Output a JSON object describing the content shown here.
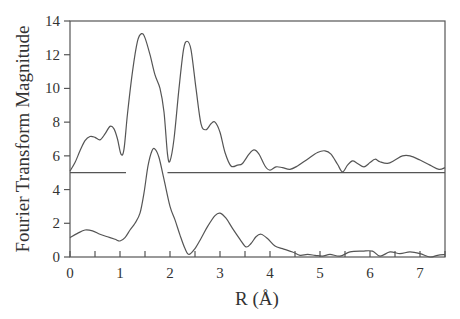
{
  "chart_data": {
    "type": "line",
    "title": "",
    "xlabel": "R (Å)",
    "ylabel": "Fourier Transform Magnitude",
    "xlim": [
      0,
      7.5
    ],
    "ylim": [
      0,
      14
    ],
    "xticks": [
      0,
      1,
      2,
      3,
      4,
      5,
      6,
      7
    ],
    "xtick_labels": [
      "0",
      "1",
      "2",
      "3",
      "4",
      "5",
      "6",
      "7"
    ],
    "yticks": [
      0,
      2,
      4,
      6,
      8,
      10,
      12,
      14
    ],
    "ytick_labels": [
      "0",
      "2",
      "4",
      "6",
      "8",
      "10",
      "12",
      "14"
    ],
    "grid": false,
    "legend": null,
    "series": [
      {
        "name": "upper spectrum (offset +5)",
        "offset": 5,
        "baseline_segments": [
          [
            0,
            1.12
          ],
          [
            1.95,
            7.5
          ]
        ],
        "points": [
          [
            0.0,
            5.1
          ],
          [
            0.1,
            5.6
          ],
          [
            0.2,
            6.3
          ],
          [
            0.3,
            6.9
          ],
          [
            0.4,
            7.15
          ],
          [
            0.5,
            7.1
          ],
          [
            0.6,
            6.95
          ],
          [
            0.7,
            7.3
          ],
          [
            0.8,
            7.75
          ],
          [
            0.88,
            7.6
          ],
          [
            0.95,
            7.0
          ],
          [
            1.02,
            6.1
          ],
          [
            1.08,
            6.4
          ],
          [
            1.15,
            8.5
          ],
          [
            1.25,
            11.0
          ],
          [
            1.35,
            12.8
          ],
          [
            1.43,
            13.25
          ],
          [
            1.5,
            13.0
          ],
          [
            1.6,
            12.0
          ],
          [
            1.7,
            10.8
          ],
          [
            1.8,
            10.0
          ],
          [
            1.88,
            8.6
          ],
          [
            1.95,
            6.1
          ],
          [
            2.0,
            5.7
          ],
          [
            2.08,
            7.0
          ],
          [
            2.18,
            10.0
          ],
          [
            2.27,
            12.3
          ],
          [
            2.34,
            12.8
          ],
          [
            2.42,
            12.3
          ],
          [
            2.52,
            10.0
          ],
          [
            2.62,
            7.9
          ],
          [
            2.72,
            7.55
          ],
          [
            2.82,
            7.9
          ],
          [
            2.9,
            8.0
          ],
          [
            3.0,
            7.4
          ],
          [
            3.1,
            6.2
          ],
          [
            3.22,
            5.4
          ],
          [
            3.35,
            5.45
          ],
          [
            3.45,
            5.55
          ],
          [
            3.58,
            6.1
          ],
          [
            3.68,
            6.35
          ],
          [
            3.78,
            6.1
          ],
          [
            3.9,
            5.4
          ],
          [
            4.0,
            5.15
          ],
          [
            4.12,
            5.35
          ],
          [
            4.25,
            5.3
          ],
          [
            4.4,
            5.2
          ],
          [
            4.55,
            5.4
          ],
          [
            4.75,
            5.8
          ],
          [
            4.95,
            6.2
          ],
          [
            5.1,
            6.3
          ],
          [
            5.22,
            6.1
          ],
          [
            5.35,
            5.5
          ],
          [
            5.45,
            5.05
          ],
          [
            5.55,
            5.45
          ],
          [
            5.65,
            5.7
          ],
          [
            5.75,
            5.55
          ],
          [
            5.88,
            5.35
          ],
          [
            6.0,
            5.6
          ],
          [
            6.1,
            5.8
          ],
          [
            6.2,
            5.65
          ],
          [
            6.35,
            5.55
          ],
          [
            6.5,
            5.75
          ],
          [
            6.65,
            6.0
          ],
          [
            6.8,
            6.0
          ],
          [
            7.0,
            5.75
          ],
          [
            7.2,
            5.45
          ],
          [
            7.38,
            5.2
          ],
          [
            7.5,
            5.3
          ]
        ]
      },
      {
        "name": "lower spectrum",
        "offset": 0,
        "points": [
          [
            0.0,
            1.15
          ],
          [
            0.15,
            1.4
          ],
          [
            0.3,
            1.6
          ],
          [
            0.45,
            1.55
          ],
          [
            0.6,
            1.35
          ],
          [
            0.75,
            1.2
          ],
          [
            0.9,
            1.05
          ],
          [
            1.0,
            0.95
          ],
          [
            1.1,
            1.15
          ],
          [
            1.2,
            1.6
          ],
          [
            1.3,
            2.0
          ],
          [
            1.4,
            2.6
          ],
          [
            1.48,
            3.8
          ],
          [
            1.56,
            5.4
          ],
          [
            1.64,
            6.3
          ],
          [
            1.7,
            6.4
          ],
          [
            1.78,
            5.9
          ],
          [
            1.88,
            4.6
          ],
          [
            2.0,
            3.0
          ],
          [
            2.1,
            2.2
          ],
          [
            2.2,
            1.3
          ],
          [
            2.3,
            0.5
          ],
          [
            2.38,
            0.15
          ],
          [
            2.5,
            0.5
          ],
          [
            2.62,
            1.1
          ],
          [
            2.75,
            1.8
          ],
          [
            2.9,
            2.45
          ],
          [
            3.0,
            2.6
          ],
          [
            3.12,
            2.3
          ],
          [
            3.25,
            1.7
          ],
          [
            3.4,
            1.05
          ],
          [
            3.52,
            0.6
          ],
          [
            3.62,
            0.8
          ],
          [
            3.72,
            1.2
          ],
          [
            3.82,
            1.35
          ],
          [
            3.95,
            1.1
          ],
          [
            4.1,
            0.65
          ],
          [
            4.25,
            0.5
          ],
          [
            4.45,
            0.3
          ],
          [
            4.6,
            0.1
          ],
          [
            4.75,
            0.15
          ],
          [
            4.9,
            0.1
          ],
          [
            5.05,
            0.05
          ],
          [
            5.2,
            0.15
          ],
          [
            5.4,
            0.05
          ],
          [
            5.6,
            0.3
          ],
          [
            5.85,
            0.35
          ],
          [
            6.05,
            0.35
          ],
          [
            6.2,
            0.05
          ],
          [
            6.4,
            0.3
          ],
          [
            6.6,
            0.2
          ],
          [
            6.8,
            0.3
          ],
          [
            7.0,
            0.2
          ],
          [
            7.2,
            0.0
          ],
          [
            7.35,
            0.1
          ],
          [
            7.5,
            0.15
          ]
        ]
      }
    ]
  }
}
